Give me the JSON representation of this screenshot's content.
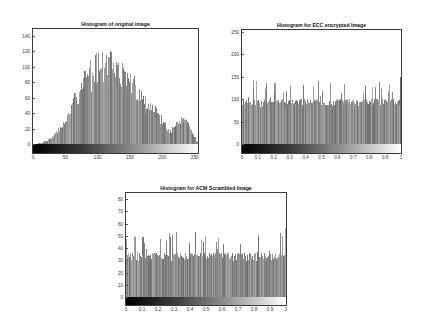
{
  "figures": [
    {
      "title": "Histogram of original image",
      "box": {
        "left": 32,
        "top": 28,
        "width": 167,
        "height": 126
      },
      "zero_y": 115,
      "px_per_unit": 0.771,
      "yticks": [
        "0",
        "20",
        "40",
        "60",
        "80",
        "100",
        "120",
        "140"
      ],
      "ytick_values": [
        0,
        20,
        40,
        60,
        80,
        100,
        120,
        140
      ],
      "xticks": [
        "0",
        "50",
        "100",
        "150",
        "200",
        "250"
      ],
      "xtick_fracs": [
        0.0,
        0.196,
        0.392,
        0.588,
        0.784,
        0.98
      ],
      "seed": 7
    },
    {
      "title": "Histogram for ECC encrypted Image",
      "box": {
        "left": 241,
        "top": 29,
        "width": 161,
        "height": 125
      },
      "zero_y": 114,
      "px_per_unit": 0.448,
      "yticks": [
        "0",
        "50",
        "100",
        "150",
        "200",
        "250"
      ],
      "ytick_values": [
        0,
        50,
        100,
        150,
        200,
        250
      ],
      "xticks": [
        "0",
        "0.1",
        "0.2",
        "0.3",
        "0.4",
        "0.5",
        "0.6",
        "0.7",
        "0.8",
        "0.9",
        "1"
      ],
      "xtick_fracs": [
        0.0,
        0.1,
        0.2,
        0.3,
        0.4,
        0.5,
        0.6,
        0.7,
        0.8,
        0.9,
        1.0
      ],
      "seed": 13
    },
    {
      "title": "Histogram for ACM Scrambled Image",
      "box": {
        "left": 125,
        "top": 192,
        "width": 162,
        "height": 114
      },
      "zero_y": 104,
      "px_per_unit": 1.225,
      "yticks": [
        "0",
        "10",
        "20",
        "30",
        "40",
        "50",
        "60",
        "70",
        "80"
      ],
      "ytick_values": [
        0,
        10,
        20,
        30,
        40,
        50,
        60,
        70,
        80
      ],
      "xticks": [
        "0",
        "0.1",
        "0.2",
        "0.3",
        "0.4",
        "0.5",
        "0.6",
        "0.7",
        "0.8",
        "0.9",
        "1"
      ],
      "xtick_fracs": [
        0.0,
        0.1,
        0.2,
        0.3,
        0.4,
        0.5,
        0.6,
        0.7,
        0.8,
        0.9,
        1.0
      ],
      "seed": 29
    }
  ],
  "chart_data": [
    {
      "type": "bar",
      "title": "Histogram of original image",
      "xlabel": "",
      "ylabel": "",
      "xlim": [
        0,
        255
      ],
      "ylim": [
        0,
        145
      ],
      "grid": false,
      "x_ticks": [
        0,
        50,
        100,
        150,
        200,
        250
      ],
      "y_ticks": [
        0,
        20,
        40,
        60,
        80,
        100,
        120,
        140
      ],
      "colorbar": "grayscale 0-255 below axis",
      "envelope": {
        "x": [
          0,
          10,
          20,
          30,
          40,
          50,
          60,
          70,
          80,
          90,
          100,
          110,
          120,
          130,
          140,
          150,
          160,
          170,
          180,
          190,
          200,
          210,
          220,
          230,
          240,
          250,
          255
        ],
        "y": [
          0,
          1,
          4,
          10,
          18,
          30,
          45,
          68,
          82,
          92,
          100,
          98,
          100,
          92,
          86,
          78,
          70,
          58,
          48,
          40,
          30,
          18,
          22,
          30,
          25,
          10,
          2
        ]
      },
      "peak": {
        "x": 97,
        "y": 118
      }
    },
    {
      "type": "bar",
      "title": "Histogram for ECC encrypted Image",
      "xlabel": "",
      "ylabel": "",
      "xlim": [
        0,
        1
      ],
      "ylim": [
        0,
        255
      ],
      "grid": false,
      "x_ticks": [
        0,
        0.1,
        0.2,
        0.3,
        0.4,
        0.5,
        0.6,
        0.7,
        0.8,
        0.9,
        1
      ],
      "y_ticks": [
        0,
        50,
        100,
        150,
        200,
        250
      ],
      "colorbar": "grayscale 0-1 below axis",
      "envelope": {
        "x": [
          0,
          1
        ],
        "y": [
          92,
          92
        ]
      },
      "range": [
        70,
        150
      ],
      "mean_approx": 92
    },
    {
      "type": "bar",
      "title": "Histogram for ACM Scrambled Image",
      "xlabel": "",
      "ylabel": "",
      "xlim": [
        0,
        1
      ],
      "ylim": [
        0,
        85
      ],
      "grid": false,
      "x_ticks": [
        0,
        0.1,
        0.2,
        0.3,
        0.4,
        0.5,
        0.6,
        0.7,
        0.8,
        0.9,
        1
      ],
      "y_ticks": [
        0,
        10,
        20,
        30,
        40,
        50,
        60,
        70,
        80
      ],
      "colorbar": "grayscale 0-1 below axis",
      "envelope": {
        "x": [
          0,
          1
        ],
        "y": [
          33,
          33
        ]
      },
      "range": [
        24,
        56
      ],
      "mean_approx": 33
    }
  ]
}
